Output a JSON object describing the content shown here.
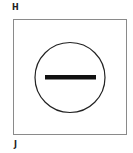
{
  "labels": {
    "top": "H",
    "bottom": "J"
  },
  "symbol": {
    "icon": "minus-circle-icon",
    "circle_color": "#222222",
    "bar_color": "#111111"
  }
}
